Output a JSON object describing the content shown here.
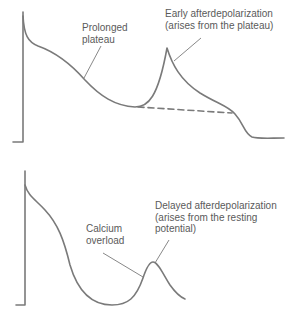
{
  "top_panel": {
    "labels": {
      "prolonged_plateau": [
        "Prolonged",
        "plateau"
      ],
      "early_afterdepolarization": [
        "Early afterdepolarization",
        "(arises from the plateau)"
      ]
    }
  },
  "bottom_panel": {
    "labels": {
      "calcium_overload": [
        "Calcium",
        "overload"
      ],
      "delayed_afterdepolarization": [
        "Delayed afterdepolarization",
        "(arises from the resting",
        "potential)"
      ]
    }
  },
  "colors": {
    "trace": "#7a7a7a",
    "text": "#5a5a5a",
    "background": "#ffffff"
  }
}
